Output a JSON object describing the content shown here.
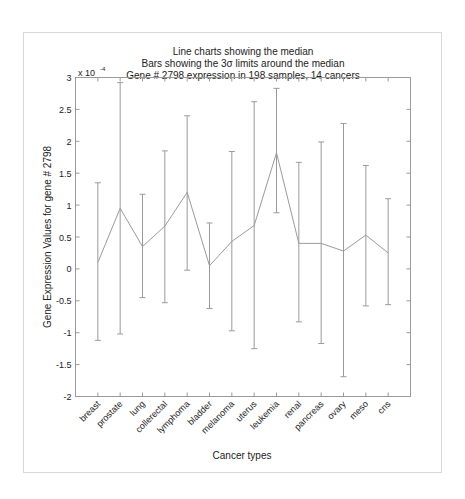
{
  "chart_data": {
    "type": "line",
    "subtype": "line-with-errorbars",
    "title": "Line charts showing the median",
    "title_lines": [
      "Line charts showing the median",
      "Bars showing the 3σ limits around the median",
      "Gene # 2798 expression in 198 samples, 14 cancers"
    ],
    "xlabel": "Cancer types",
    "ylabel": "Gene Expression Values for gene # 2798",
    "y_scale_label": "x 10",
    "y_scale_exponent": "-4",
    "ylim": [
      -2,
      3
    ],
    "yticks": [
      -2,
      -1.5,
      -1,
      -0.5,
      0,
      0.5,
      1,
      1.5,
      2,
      2.5,
      3
    ],
    "ytick_labels": [
      "-2",
      "-1.5",
      "-1",
      "-0.5",
      "0",
      "0.5",
      "1",
      "1.5",
      "2",
      "2.5",
      "3"
    ],
    "grid": false,
    "categories": [
      "breast",
      "prostate",
      "lung",
      "collerectal",
      "lymphoma",
      "bladder",
      "melanoma",
      "uterus",
      "leukemia",
      "renal",
      "pancreas",
      "ovary",
      "meso",
      "cns"
    ],
    "series": [
      {
        "name": "median",
        "values": [
          0.1,
          0.95,
          0.35,
          0.67,
          1.2,
          0.05,
          0.43,
          0.68,
          1.82,
          0.4,
          0.4,
          0.28,
          0.53,
          0.25
        ]
      },
      {
        "name": "upper_3sigma",
        "values": [
          1.35,
          2.92,
          1.17,
          1.85,
          2.4,
          0.72,
          1.84,
          2.62,
          2.83,
          1.67,
          1.99,
          2.28,
          1.62,
          1.1
        ]
      },
      {
        "name": "lower_3sigma",
        "values": [
          -1.12,
          -1.02,
          -0.45,
          -0.53,
          -0.02,
          -0.62,
          -0.97,
          -1.25,
          0.88,
          -0.83,
          -1.17,
          -1.69,
          -0.58,
          -0.56
        ]
      }
    ],
    "colors": {
      "line": "#9a9a9a",
      "axis": "#9a9a9a",
      "text": "#222222",
      "frame": "#d8d8d8"
    }
  }
}
